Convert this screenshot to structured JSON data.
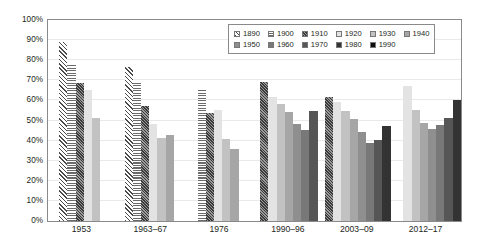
{
  "chart_data": {
    "type": "bar",
    "title": "",
    "subtitle": "",
    "xlabel": "",
    "ylabel": "",
    "ylim": [
      0,
      100
    ],
    "y_tick_labels": [
      "100%",
      "90%",
      "80%",
      "70%",
      "60%",
      "50%",
      "40%",
      "30%",
      "20%",
      "10%",
      "0%"
    ],
    "y_tick_values": [
      100,
      90,
      80,
      70,
      60,
      50,
      40,
      30,
      20,
      10,
      0
    ],
    "grid": true,
    "grid_axis": "y",
    "legend_position": "top-right",
    "value_unit": "percent",
    "categories": [
      "1953",
      "1963–67",
      "1976",
      "1990–96",
      "2003–09",
      "2012–17"
    ],
    "series": [
      {
        "name": "1890",
        "fill": "diagonal-hatch",
        "color": "#4a4a4a",
        "values": [
          89,
          76.5,
          null,
          null,
          null,
          null
        ]
      },
      {
        "name": "1900",
        "fill": "horizontal-stripe",
        "color": "#6b6b6b",
        "values": [
          78,
          68.5,
          65.5,
          null,
          null,
          null
        ]
      },
      {
        "name": "1910",
        "fill": "checker",
        "color": "#8c8c8c",
        "values": [
          68.5,
          57,
          53.5,
          69,
          61.5,
          null
        ]
      },
      {
        "name": "1920",
        "fill": "solid",
        "color": "#e3e3e3",
        "values": [
          65,
          48.5,
          55,
          61.5,
          59,
          67
        ]
      },
      {
        "name": "1930",
        "fill": "solid",
        "color": "#c2c2c2",
        "values": [
          51.5,
          41.5,
          41,
          58,
          54.5,
          55
        ]
      },
      {
        "name": "1940",
        "fill": "solid",
        "color": "#a6a6a6",
        "values": [
          null,
          43,
          36,
          54,
          51,
          49
        ]
      },
      {
        "name": "1950",
        "fill": "solid",
        "color": "#8f8f8f",
        "values": [
          null,
          null,
          null,
          48.5,
          44.5,
          46
        ]
      },
      {
        "name": "1960",
        "fill": "solid",
        "color": "#787878",
        "values": [
          null,
          null,
          null,
          45.5,
          39,
          48
        ]
      },
      {
        "name": "1970",
        "fill": "solid",
        "color": "#565656",
        "values": [
          null,
          null,
          null,
          54.5,
          40.5,
          51.5
        ]
      },
      {
        "name": "1980",
        "fill": "solid",
        "color": "#333333",
        "values": [
          null,
          null,
          null,
          null,
          47.5,
          60
        ]
      },
      {
        "name": "1990",
        "fill": "solid",
        "color": "#0d0d0d",
        "values": [
          null,
          null,
          null,
          null,
          null,
          null
        ]
      }
    ]
  },
  "legend": {
    "rows": [
      [
        "1890",
        "1900",
        "1910",
        "1920",
        "1930",
        "1940"
      ],
      [
        "1950",
        "1960",
        "1970",
        "1980",
        "1990"
      ]
    ]
  }
}
